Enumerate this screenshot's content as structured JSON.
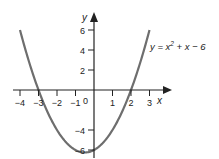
{
  "chart_data": {
    "type": "line",
    "title": "",
    "function": "y = x^2 + x - 6",
    "equation_label": {
      "prefix": "y = x",
      "superscript": "2",
      "suffix": " + x − 6"
    },
    "xlabel": "x",
    "ylabel": "y",
    "xlim": [
      -4,
      3
    ],
    "ylim": [
      -6.25,
      6
    ],
    "x_ticks": [
      -4,
      -3,
      -2,
      -1,
      1,
      2,
      3
    ],
    "x_tick_labels": [
      "−4",
      "−3",
      "−2",
      "−1",
      "1",
      "2",
      "3"
    ],
    "y_ticks": [
      6,
      4,
      2,
      -4,
      -6
    ],
    "y_tick_labels": [
      "6",
      "4",
      "2",
      "−4",
      "−6"
    ],
    "origin_label": "0",
    "grid": false,
    "series": [
      {
        "name": "y = x^2 + x - 6",
        "x": [
          -4,
          -3.5,
          -3,
          -2.5,
          -2,
          -1.5,
          -1,
          -0.5,
          0,
          0.5,
          1,
          1.5,
          2,
          2.5,
          3
        ],
        "y": [
          6,
          2.75,
          0,
          -2.25,
          -4,
          -5.25,
          -6,
          -6.25,
          -6,
          -5.25,
          -4,
          -2.25,
          0,
          2.75,
          6
        ]
      }
    ],
    "roots": [
      -3,
      2
    ],
    "y_intercept": -6,
    "vertex": [
      -0.5,
      -6.25
    ],
    "colors": {
      "curve": "#6e6e6e",
      "axes": "#222222"
    }
  }
}
